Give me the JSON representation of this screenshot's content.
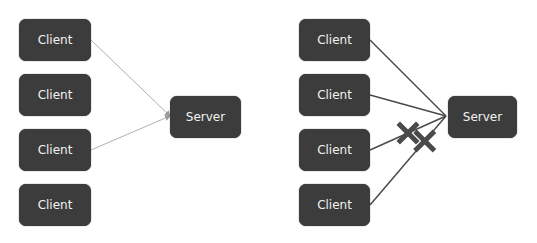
{
  "diagrams": [
    {
      "name": "left",
      "clients": [
        "Client",
        "Client",
        "Client",
        "Client"
      ],
      "server": "Server",
      "connections": [
        {
          "from_client": 0,
          "style": "thin-arrow",
          "blocked": false
        },
        {
          "from_client": 2,
          "style": "thin-arrow",
          "blocked": false
        }
      ]
    },
    {
      "name": "right",
      "clients": [
        "Client",
        "Client",
        "Client",
        "Client"
      ],
      "server": "Server",
      "connections": [
        {
          "from_client": 0,
          "style": "line",
          "blocked": false
        },
        {
          "from_client": 1,
          "style": "line",
          "blocked": false
        },
        {
          "from_client": 2,
          "style": "line",
          "blocked": true
        },
        {
          "from_client": 3,
          "style": "line",
          "blocked": true
        }
      ]
    }
  ],
  "colors": {
    "node_fill": "#3c3c3c",
    "node_text": "#f2f2f2",
    "thin_line": "#b0b0b0",
    "thick_line": "#4a4a4a",
    "blocked_mark": "#4a4a4a"
  }
}
